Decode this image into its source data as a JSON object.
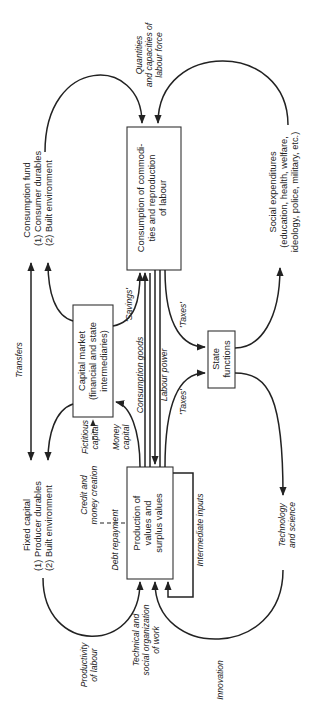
{
  "diagram": {
    "orientation": "rotated 90 degrees counter-clockwise",
    "nodes": {
      "consumption": {
        "lines": [
          "Consumption of commodi-",
          "ties and reproduction",
          "of labour"
        ]
      },
      "production": {
        "lines": [
          "Production of",
          "values and",
          "surplus values"
        ]
      },
      "capital_market": {
        "lines": [
          "Capital market",
          "(financial and state",
          "intermediaries)"
        ]
      },
      "state": {
        "lines": [
          "State",
          "functions"
        ]
      },
      "consumption_fund": {
        "lines": [
          "Consumption fund",
          "(1) Consumer durables",
          "(2) Built environment"
        ]
      },
      "fixed_capital": {
        "lines": [
          "Fixed capital",
          "(1) Producer durables",
          "(2) Built environment"
        ]
      },
      "social_expenditures": {
        "lines": [
          "Social expenditures",
          "(education, health, welfare,",
          "ideology, police, military, etc.)"
        ]
      }
    },
    "edge_labels": {
      "quantities": [
        "Quantities",
        "and capacities of",
        "labour force"
      ],
      "transfers": "Transfers",
      "savings": "'Savings'",
      "consumption_goods": "Consumption goods",
      "labour_power": "Labour power",
      "taxes_top": "'Taxes'",
      "taxes_bottom": "'Taxes'",
      "money_capital": [
        "Money",
        "capital"
      ],
      "fictitious_capital": [
        "Fictitious",
        "capital"
      ],
      "credit": [
        "Credit and",
        "money creation"
      ],
      "debt_repayment": "Debt repayment",
      "intermediate_inputs": "Intermediate inputs",
      "technology": [
        "Technology",
        "and science"
      ],
      "innovation": "Innovation",
      "productivity": [
        "Productivity",
        "of labour"
      ],
      "technical": [
        "Technical and",
        "social organization",
        "of work"
      ]
    }
  }
}
